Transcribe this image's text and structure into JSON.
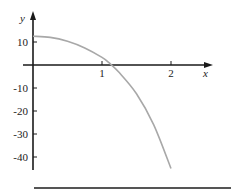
{
  "chart_data": {
    "type": "line",
    "title": "",
    "xlabel": "x",
    "ylabel": "y",
    "xlim": [
      0,
      2.1
    ],
    "ylim": [
      -45,
      15
    ],
    "grid": false,
    "legend": null,
    "x_ticks": [
      {
        "value": 1,
        "label": "1"
      },
      {
        "value": 2,
        "label": "2"
      }
    ],
    "y_ticks": [
      {
        "value": 10,
        "label": "10"
      },
      {
        "value": -10,
        "label": "-10"
      },
      {
        "value": -20,
        "label": "-20"
      },
      {
        "value": -30,
        "label": "-30"
      },
      {
        "value": -40,
        "label": "-40"
      }
    ],
    "series": [
      {
        "name": "f(x)",
        "color": "#a8a8a8",
        "x": [
          0,
          0.25,
          0.5,
          0.75,
          1.0,
          1.1,
          1.25,
          1.5,
          1.75,
          2.0
        ],
        "y": [
          12.5,
          12.0,
          10.3,
          7.4,
          3.3,
          1.0,
          -3.3,
          -12.5,
          -26,
          -45
        ]
      }
    ]
  },
  "colors": {
    "axis": "#1a1a1a",
    "curve": "#a8a8a8",
    "rule": "#555555"
  }
}
